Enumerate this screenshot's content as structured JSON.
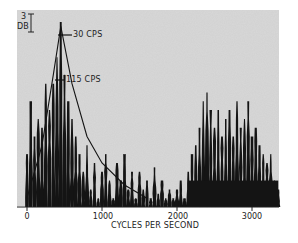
{
  "chart_data": {
    "type": "bar",
    "title": "",
    "xlabel": "CYCLES PER SECOND",
    "ylabel": "",
    "xlim": [
      0,
      3400
    ],
    "xticks": [
      0,
      1000,
      2000,
      3000
    ],
    "xtick_labels": [
      "0",
      "1000",
      "2000",
      "3000"
    ],
    "scale_marker": {
      "value": "3",
      "unit": "DB"
    },
    "annotations": [
      {
        "text": "30 CPS",
        "x": 450,
        "note": "bandwidth marker near peak"
      },
      {
        "text": "115 CPS",
        "x": 450,
        "note": "bandwidth marker below peak"
      }
    ],
    "grid": false,
    "legend": "none",
    "series": [
      {
        "name": "spectrum",
        "x": [
          0,
          50,
          100,
          150,
          200,
          250,
          300,
          350,
          400,
          450,
          500,
          550,
          600,
          650,
          700,
          750,
          800,
          850,
          900,
          950,
          1000,
          1050,
          1100,
          1150,
          1200,
          1250,
          1300,
          1350,
          1400,
          1450,
          1500,
          1550,
          1600,
          1650,
          1700,
          1750,
          1800,
          1850,
          1900,
          1950,
          2000,
          2050,
          2100,
          2150,
          2200,
          2250,
          2300,
          2350,
          2400,
          2450,
          2500,
          2550,
          2600,
          2650,
          2700,
          2750,
          2800,
          2850,
          2900,
          2950,
          3000,
          3050,
          3100,
          3150,
          3200,
          3250,
          3300,
          3350
        ],
        "values_db_relative": [
          -30,
          -18,
          -26,
          -22,
          -24,
          -14,
          -20,
          -14,
          -8,
          0,
          -12,
          -18,
          -22,
          -26,
          -30,
          -34,
          -28,
          -38,
          -32,
          -40,
          -34,
          -30,
          -36,
          -40,
          -32,
          -36,
          -30,
          -38,
          -34,
          -40,
          -34,
          -38,
          -36,
          -40,
          -33,
          -39,
          -36,
          -40,
          -38,
          -40,
          -38,
          -36,
          -40,
          -34,
          -30,
          -28,
          -24,
          -18,
          -16,
          -20,
          -24,
          -20,
          -26,
          -22,
          -20,
          -26,
          -18,
          -24,
          -22,
          -18,
          -26,
          -24,
          -28,
          -30,
          -32,
          -30,
          -36,
          -38
        ]
      },
      {
        "name": "resonance envelope",
        "type": "line",
        "x": [
          0,
          200,
          350,
          450,
          600,
          800,
          1000,
          1300,
          1600
        ],
        "values_db_relative": [
          -40,
          -28,
          -12,
          -1,
          -14,
          -26,
          -32,
          -37,
          -40
        ]
      }
    ]
  }
}
